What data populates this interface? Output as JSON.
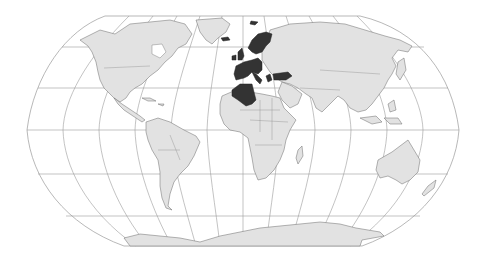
{
  "map": {
    "projection": "Robinson",
    "width": 482,
    "height": 262,
    "colors": {
      "background": "#ffffff",
      "land": "#e2e2e2",
      "highlight": "#333333",
      "graticule": "#9a9a9a",
      "coastline": "#6a6a6a"
    },
    "highlighted_regions": [
      "Iceland",
      "Svalbard",
      "Norway",
      "Sweden",
      "Finland",
      "Denmark",
      "United Kingdom",
      "Ireland",
      "Netherlands",
      "Belgium",
      "Luxembourg",
      "France",
      "Germany",
      "Switzerland",
      "Austria",
      "Italy",
      "Spain",
      "Portugal",
      "Greece",
      "Turkey",
      "Algeria"
    ],
    "legend": null
  }
}
